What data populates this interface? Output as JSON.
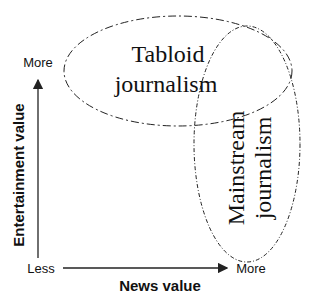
{
  "diagram": {
    "y_axis": {
      "label": "Entertainment value",
      "low": "Less",
      "high": "More"
    },
    "x_axis": {
      "label": "News value",
      "high": "More"
    },
    "regions": [
      {
        "line1": "Tabloid",
        "line2": "journalism"
      },
      {
        "line1": "Mainstream",
        "line2": "journalism"
      }
    ],
    "colors": {
      "line": "#222222",
      "text": "#111111",
      "background": "#ffffff"
    }
  }
}
